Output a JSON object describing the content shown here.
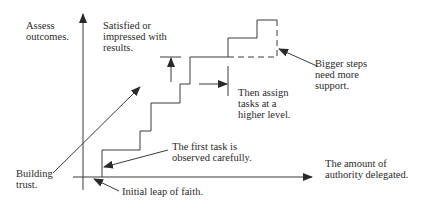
{
  "diagram": {
    "axes": {
      "y_label": "Assess\noutcomes.",
      "x_label": "The amount of\nauthority delegated."
    },
    "annotations": {
      "satisfied": "Satisfied or\nimpressed with\nresults.",
      "bigger_steps": "Bigger steps\nneed more\nsupport.",
      "then_assign": "Then assign\ntasks at a\nhigher level.",
      "first_task": "The first task is\nobserved carefully.",
      "building_trust": "Building\ntrust.",
      "initial_leap": "Initial leap of faith."
    },
    "staircase_points": [
      [
        102,
        177
      ],
      [
        102,
        150
      ],
      [
        140,
        150
      ],
      [
        140,
        131
      ],
      [
        151,
        131
      ],
      [
        151,
        103
      ],
      [
        180,
        103
      ],
      [
        180,
        84
      ],
      [
        190,
        84
      ],
      [
        190,
        57
      ],
      [
        228,
        57
      ],
      [
        228,
        38
      ],
      [
        257,
        38
      ],
      [
        257,
        20
      ],
      [
        277,
        20
      ]
    ],
    "colors": {
      "line": "#3a3a3a",
      "text": "#2a2a2a",
      "background": "#ffffff"
    }
  }
}
